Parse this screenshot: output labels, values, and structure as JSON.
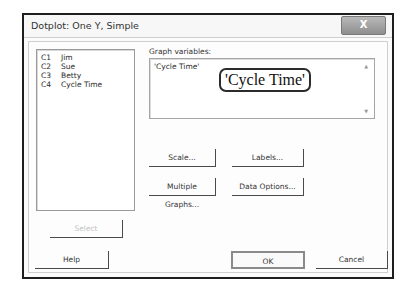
{
  "window": {
    "title": "Dotplot: One Y, Simple",
    "close_icon": "X"
  },
  "variables_list": {
    "items": [
      {
        "col": "C1",
        "name": "Jim"
      },
      {
        "col": "C2",
        "name": "Sue"
      },
      {
        "col": "C3",
        "name": "Betty"
      },
      {
        "col": "C4",
        "name": "Cycle Time"
      }
    ]
  },
  "graph_variables": {
    "label": "Graph variables:",
    "value": "'Cycle Time'",
    "callout": "'Cycle Time'"
  },
  "buttons": {
    "scale": "Scale...",
    "labels": "Labels...",
    "multiple_graphs": "Multiple Graphs...",
    "data_options": "Data Options...",
    "select": "Select",
    "help": "Help",
    "ok": "OK",
    "cancel": "Cancel"
  }
}
